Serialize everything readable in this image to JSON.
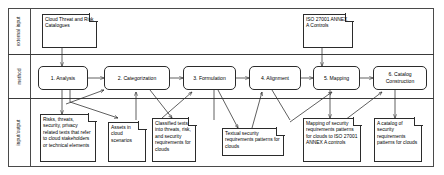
{
  "diagram": {
    "lanes": [
      {
        "id": "external-input",
        "label": "external input"
      },
      {
        "id": "method",
        "label": "method"
      },
      {
        "id": "input-output",
        "label": "input/output"
      }
    ],
    "external_inputs": [
      {
        "id": "cloud-threat-risk-catalogues",
        "label": "Cloud Threat and Risk Catalogues"
      },
      {
        "id": "iso-27001-annex-a-controls",
        "label": "ISO 27001 ANNEX A Controls"
      }
    ],
    "steps": [
      {
        "id": "step-1",
        "number": "1.",
        "label": "1. Analysis"
      },
      {
        "id": "step-2",
        "number": "2.",
        "label": "2. Categorization"
      },
      {
        "id": "step-3",
        "number": "3.",
        "label": "3. Formulation"
      },
      {
        "id": "step-4",
        "number": "4.",
        "label": "4. Alignment"
      },
      {
        "id": "step-5",
        "number": "5.",
        "label": "5. Mapping"
      },
      {
        "id": "step-6",
        "number": "6.",
        "label": "6. Catalog Construction"
      }
    ],
    "artifacts": [
      {
        "id": "risks-threats-texts",
        "label": "Risks, threats, security, privacy related texts that refer to cloud stakeholders or technical elements"
      },
      {
        "id": "assets-cloud-scenarios",
        "label": "Assets in cloud scenarios"
      },
      {
        "id": "classified-texts",
        "label": "Classified texts into threats, risk, and security requirements for clouds"
      },
      {
        "id": "textual-security-patterns",
        "label": "Textual security requirements patterns for clouds"
      },
      {
        "id": "mapping-to-iso",
        "label": "Mapping of security requirements patterns for clouds to ISO 27001 ANNEX A controls"
      },
      {
        "id": "catalog-of-patterns",
        "label": "A catalog of security requirements patterns for clouds"
      }
    ],
    "colors": {
      "stroke": "#2b2b2b",
      "frame": "#4a4a4a",
      "background": "#ffffff",
      "text": "#000000"
    }
  }
}
